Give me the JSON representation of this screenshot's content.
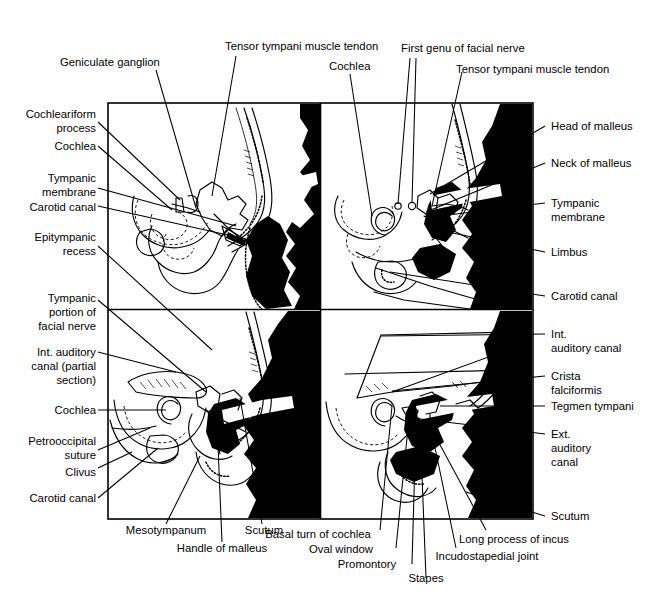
{
  "figure": {
    "panel_count": 4,
    "accent_color": "#000000",
    "background_color": "#ffffff"
  },
  "labels": {
    "top": [
      {
        "id": "geniculate-ganglion",
        "text": "Geniculate ganglion"
      },
      {
        "id": "tensor-tympani-muscle-tendon-left",
        "text": "Tensor tympani muscle tendon"
      },
      {
        "id": "cochlea-top",
        "text": "Cochlea"
      },
      {
        "id": "first-genu-of-facial-nerve",
        "text": "First genu of facial nerve"
      },
      {
        "id": "tensor-tympani-muscle-tendon-right",
        "text": "Tensor tympani muscle tendon"
      }
    ],
    "left": [
      {
        "id": "cochleariform-process",
        "lines": [
          "Cochleariform",
          "process"
        ]
      },
      {
        "id": "cochlea-upper-left",
        "lines": [
          "Cochlea"
        ]
      },
      {
        "id": "tympanic-membrane-left",
        "lines": [
          "Tympanic",
          "membrane"
        ]
      },
      {
        "id": "carotid-canal-upper-left",
        "lines": [
          "Carotid canal"
        ]
      },
      {
        "id": "epitympanic-recess",
        "lines": [
          "Epitympanic",
          "recess"
        ]
      },
      {
        "id": "tympanic-portion-of-facial-nerve",
        "lines": [
          "Tympanic",
          "portion of",
          "facial nerve"
        ]
      },
      {
        "id": "int-auditory-canal-partial-section",
        "lines": [
          "Int. auditory",
          "canal (partial",
          "section)"
        ]
      },
      {
        "id": "cochlea-lower-left",
        "lines": [
          "Cochlea"
        ]
      },
      {
        "id": "petrooccipital-suture",
        "lines": [
          "Petrooccipital",
          "suture"
        ]
      },
      {
        "id": "clivus",
        "lines": [
          "Clivus"
        ]
      },
      {
        "id": "carotid-canal-lower-left",
        "lines": [
          "Carotid canal"
        ]
      }
    ],
    "right": [
      {
        "id": "head-of-malleus",
        "lines": [
          "Head of malleus"
        ]
      },
      {
        "id": "neck-of-malleus",
        "lines": [
          "Neck of malleus"
        ]
      },
      {
        "id": "tympanic-membrane-right",
        "lines": [
          "Tympanic",
          "membrane"
        ]
      },
      {
        "id": "limbus",
        "lines": [
          "Limbus"
        ]
      },
      {
        "id": "carotid-canal-right",
        "lines": [
          "Carotid canal"
        ]
      },
      {
        "id": "int-auditory-canal",
        "lines": [
          "Int.",
          "auditory canal"
        ]
      },
      {
        "id": "crista-falciformis",
        "lines": [
          "Crista",
          "falciformis"
        ]
      },
      {
        "id": "tegmen-tympani",
        "lines": [
          "Tegmen tympani"
        ]
      },
      {
        "id": "ext-auditory-canal",
        "lines": [
          "Ext.",
          "auditory",
          "canal"
        ]
      },
      {
        "id": "scutum-right",
        "lines": [
          "Scutum"
        ]
      }
    ],
    "bottom": [
      {
        "id": "mesotympanum",
        "text": "Mesotympanum"
      },
      {
        "id": "handle-of-malleus",
        "text": "Handle of malleus"
      },
      {
        "id": "scutum-bottom",
        "text": "Scutum"
      },
      {
        "id": "basal-turn-of-cochlea",
        "text": "Basal turn of cochlea"
      },
      {
        "id": "oval-window",
        "text": "Oval window"
      },
      {
        "id": "promontory",
        "text": "Promontory"
      },
      {
        "id": "stapes",
        "text": "Stapes"
      },
      {
        "id": "incudostapedial-joint",
        "text": "Incudostapedial joint"
      },
      {
        "id": "long-process-of-incus",
        "text": "Long process of incus"
      }
    ]
  },
  "text": {
    "geniculate_ganglion": "Geniculate ganglion",
    "tensor_tympani_left": "Tensor tympani muscle tendon",
    "cochlea_top": "Cochlea",
    "first_genu": "First genu of facial nerve",
    "tensor_tympani_right": "Tensor tympani muscle tendon",
    "cochleariform_1": "Cochleariform",
    "cochleariform_2": "process",
    "cochlea_ul": "Cochlea",
    "tympanic_membrane_l1": "Tympanic",
    "tympanic_membrane_l2": "membrane",
    "carotid_canal_ul": "Carotid canal",
    "epitympanic_1": "Epitympanic",
    "epitympanic_2": "recess",
    "tympanic_portion_1": "Tympanic",
    "tympanic_portion_2": "portion of",
    "tympanic_portion_3": "facial nerve",
    "iac_partial_1": "Int. auditory",
    "iac_partial_2": "canal (partial",
    "iac_partial_3": "section)",
    "cochlea_ll": "Cochlea",
    "petrooccipital_1": "Petrooccipital",
    "petrooccipital_2": "suture",
    "clivus": "Clivus",
    "carotid_canal_ll": "Carotid canal",
    "head_of_malleus": "Head of malleus",
    "neck_of_malleus": "Neck of malleus",
    "tympanic_membrane_r1": "Tympanic",
    "tympanic_membrane_r2": "membrane",
    "limbus": "Limbus",
    "carotid_canal_r": "Carotid canal",
    "iac_1": "Int.",
    "iac_2": "auditory canal",
    "crista_1": "Crista",
    "crista_2": "falciformis",
    "tegmen_tympani": "Tegmen tympani",
    "eac_1": "Ext.",
    "eac_2": "auditory",
    "eac_3": "canal",
    "scutum_r": "Scutum",
    "mesotympanum": "Mesotympanum",
    "handle_of_malleus": "Handle of malleus",
    "scutum_b": "Scutum",
    "basal_turn": "Basal turn of cochlea",
    "oval_window": "Oval window",
    "promontory": "Promontory",
    "stapes": "Stapes",
    "incudostapedial": "Incudostapedial joint",
    "long_process": "Long process of incus"
  }
}
